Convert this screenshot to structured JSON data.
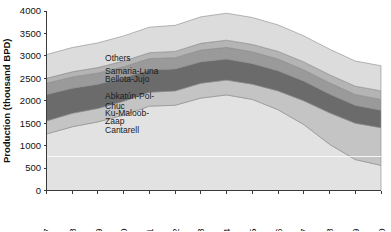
{
  "chart_data": {
    "type": "area",
    "stacked": true,
    "title": "",
    "xlabel": "",
    "ylabel": "Production (thousand BPD)",
    "ylim": [
      0,
      4000
    ],
    "ytick_values": [
      0,
      500,
      1000,
      1500,
      2000,
      2500,
      3000,
      3500,
      4000
    ],
    "ytick_labels": [
      "0",
      "500",
      "1000",
      "1500",
      "2000",
      "2500",
      "3000",
      "3500",
      "4000"
    ],
    "grid": false,
    "legend_position": "inline-annotations",
    "categories": [
      1997,
      1998,
      1999,
      2000,
      2001,
      2002,
      2003,
      2004,
      2005,
      2006,
      2007,
      2008,
      2009,
      2010
    ],
    "xtick_labels": [
      "1997",
      "1998",
      "1999",
      "2000",
      "2001",
      "2002",
      "2003",
      "2004",
      "2005",
      "2006",
      "2007",
      "2008",
      "2009",
      "2010"
    ],
    "series": [
      {
        "name": "Cantarell",
        "color": "#e2e2e2",
        "values": [
          1260,
          1420,
          1530,
          1680,
          1880,
          1900,
          2060,
          2130,
          2030,
          1800,
          1470,
          1030,
          690,
          560
        ]
      },
      {
        "name": "Ku-Maloob-Zaap",
        "color": "#c4c4c4",
        "values": [
          290,
          300,
          300,
          310,
          310,
          320,
          330,
          330,
          340,
          420,
          530,
          700,
          810,
          840
        ]
      },
      {
        "name": "Abkatún-Pol-Chuc",
        "color": "#6b6b6b",
        "values": [
          590,
          560,
          540,
          520,
          500,
          490,
          480,
          470,
          460,
          450,
          440,
          420,
          400,
          390
        ]
      },
      {
        "name": "Bellota-Jujo",
        "color": "#9a9a9a",
        "values": [
          250,
          250,
          250,
          250,
          250,
          250,
          260,
          260,
          260,
          260,
          250,
          250,
          240,
          240
        ]
      },
      {
        "name": "Samaria-Luna",
        "color": "#b4b4b4",
        "values": [
          110,
          115,
          120,
          125,
          130,
          140,
          150,
          160,
          165,
          170,
          175,
          180,
          185,
          190
        ]
      },
      {
        "name": "Others",
        "color": "#dcdcdc",
        "values": [
          530,
          540,
          550,
          560,
          570,
          580,
          590,
          600,
          600,
          590,
          580,
          570,
          560,
          560
        ]
      }
    ],
    "annotations": [
      {
        "text": "Others",
        "x_pct": 0.175,
        "y_value": 2880
      },
      {
        "text": "Samaria-Luna",
        "x_pct": 0.175,
        "y_value": 2600
      },
      {
        "text": "Bellota-Jujo",
        "x_pct": 0.175,
        "y_value": 2420
      },
      {
        "text": "Abkatún-Pol-",
        "x_pct": 0.175,
        "y_value": 2030
      },
      {
        "text": "Chuc",
        "x_pct": 0.175,
        "y_value": 1810
      },
      {
        "text": "Ku-Maloob-",
        "x_pct": 0.175,
        "y_value": 1650
      },
      {
        "text": "Zaap",
        "x_pct": 0.175,
        "y_value": 1480
      },
      {
        "text": "Cantarell",
        "x_pct": 0.175,
        "y_value": 1280
      }
    ],
    "faint_gridline_value": 750
  }
}
